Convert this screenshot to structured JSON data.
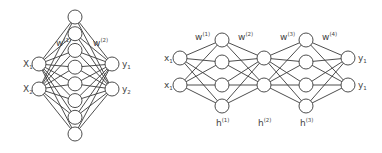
{
  "diagrams": [
    {
      "name": "shallow-network",
      "layers": [
        {
          "name": "input",
          "count": 2,
          "labels": [
            {
              "base": "X",
              "sub": "1"
            },
            {
              "base": "X",
              "sub": "2"
            }
          ],
          "label_side": "left"
        },
        {
          "name": "hidden",
          "count": 8,
          "labels": []
        },
        {
          "name": "output",
          "count": 2,
          "labels": [
            {
              "base": "y",
              "sub": "1"
            },
            {
              "base": "y",
              "sub": "2"
            }
          ],
          "label_side": "right"
        }
      ],
      "weight_labels": [
        {
          "base": "w",
          "sup": "(1)"
        },
        {
          "base": "w",
          "sup": "(2)"
        }
      ],
      "hidden_labels": []
    },
    {
      "name": "deep-network",
      "layers": [
        {
          "name": "input",
          "count": 2,
          "labels": [
            {
              "base": "x",
              "sub": "1"
            },
            {
              "base": "x",
              "sub": "1"
            }
          ],
          "label_side": "left"
        },
        {
          "name": "hidden-1",
          "count": 4,
          "labels": []
        },
        {
          "name": "hidden-2",
          "count": 2,
          "labels": []
        },
        {
          "name": "hidden-3",
          "count": 4,
          "labels": []
        },
        {
          "name": "output",
          "count": 2,
          "labels": [
            {
              "base": "y",
              "sub": "1"
            },
            {
              "base": "y",
              "sub": "1"
            }
          ],
          "label_side": "right"
        }
      ],
      "weight_labels": [
        {
          "base": "w",
          "sup": "(1)"
        },
        {
          "base": "w",
          "sup": "(2)"
        },
        {
          "base": "w",
          "sup": "(3)"
        },
        {
          "base": "w",
          "sup": "(4)"
        }
      ],
      "hidden_labels": [
        {
          "base": "h",
          "sup": "(1)"
        },
        {
          "base": "h",
          "sup": "(2)"
        },
        {
          "base": "h",
          "sup": "(3)"
        }
      ]
    }
  ]
}
